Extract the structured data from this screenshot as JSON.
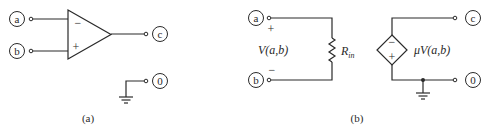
{
  "panel_a": {
    "caption": "(a)",
    "terminals": {
      "a": "a",
      "b": "b",
      "c": "c",
      "ground": "0"
    },
    "opamp": {
      "inverting_sign": "−",
      "noninverting_sign": "+"
    }
  },
  "panel_b": {
    "caption": "(b)",
    "terminals": {
      "a": "a",
      "b": "b",
      "c": "c",
      "ground": "0"
    },
    "input_polarity": {
      "plus": "+",
      "minus": "−"
    },
    "input_voltage_label": "V(a,b)",
    "resistor_label": "R",
    "resistor_subscript": "in",
    "source": {
      "minus": "−",
      "plus": "+",
      "label": "μV(a,b)"
    }
  }
}
